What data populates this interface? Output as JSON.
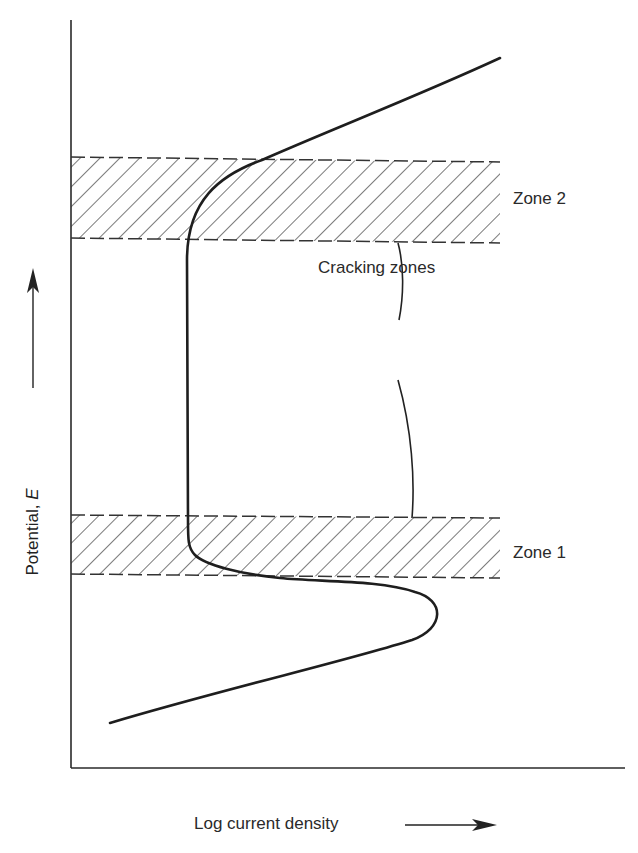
{
  "diagram": {
    "type": "polarization-curve",
    "axes": {
      "x_label": "Log current density",
      "y_label_prefix": "Potential, ",
      "y_label_symbol": "E",
      "x_arrow": "right-arrow",
      "y_arrow": "up-arrow"
    },
    "zones": [
      {
        "id": "zone1",
        "label": "Zone 1",
        "pattern": "diagonal-hatch",
        "border": "dashed"
      },
      {
        "id": "zone2",
        "label": "Zone 2",
        "pattern": "diagonal-hatch",
        "border": "dashed"
      }
    ],
    "annotation": {
      "label": "Cracking zones",
      "connector": "brace-lines to Zone 1 and Zone 2"
    },
    "colors": {
      "line": "#1e1e1e",
      "hatch": "#333333",
      "background": "#ffffff"
    }
  }
}
